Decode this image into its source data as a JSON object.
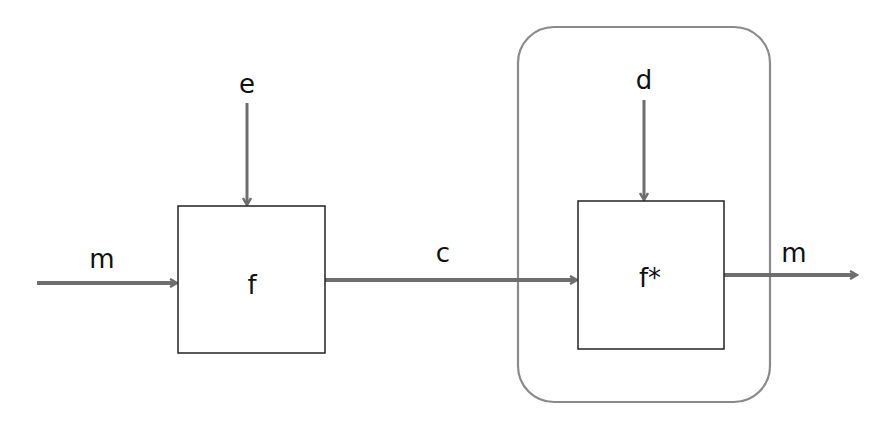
{
  "diagram": {
    "type": "block-diagram",
    "colors": {
      "arrow": "#6e6e6e",
      "box_border": "#222222",
      "container_border": "#8a8a8a",
      "text": "#111111"
    },
    "blocks": [
      {
        "id": "f",
        "label": "f"
      },
      {
        "id": "fstar",
        "label": "f*"
      }
    ],
    "container": {
      "label": "",
      "contains": [
        "fstar",
        "d"
      ]
    },
    "signals": [
      {
        "id": "m_in",
        "label": "m",
        "from": "left",
        "to": "f"
      },
      {
        "id": "e",
        "label": "e",
        "from": "top",
        "to": "f"
      },
      {
        "id": "c",
        "label": "c",
        "from": "f",
        "to": "fstar"
      },
      {
        "id": "d",
        "label": "d",
        "from": "top",
        "to": "fstar"
      },
      {
        "id": "m_out",
        "label": "m",
        "from": "fstar",
        "to": "right"
      }
    ]
  }
}
